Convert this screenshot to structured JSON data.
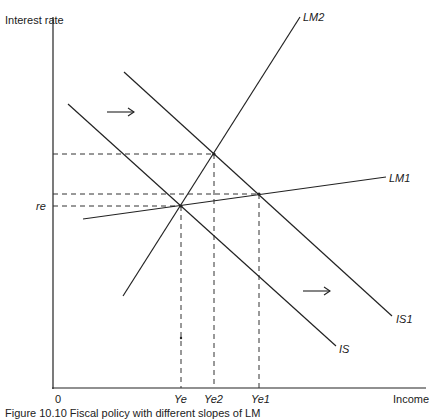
{
  "diagram": {
    "axes": {
      "y_label": "Interest rate",
      "x_label": "Income",
      "origin_label": "0"
    },
    "curves": [
      {
        "id": "IS",
        "label": "IS"
      },
      {
        "id": "IS1",
        "label": "IS1"
      },
      {
        "id": "LM1",
        "label": "LM1"
      },
      {
        "id": "LM2",
        "label": "LM2"
      }
    ],
    "y_marks": [
      {
        "label": "re"
      }
    ],
    "x_marks": [
      {
        "label": "Ye"
      },
      {
        "label": "Ye2"
      },
      {
        "label": "Ye1"
      }
    ],
    "arrows": [
      {
        "meaning": "IS shifts right (upper)"
      },
      {
        "meaning": "IS shifts right (lower)"
      }
    ],
    "caption": "Figure 10.10   Fiscal policy with different slopes of LM"
  }
}
